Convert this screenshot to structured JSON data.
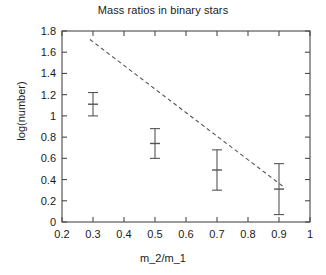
{
  "chart_data": {
    "type": "scatter",
    "title": "Mass ratios in binary stars",
    "xlabel": "m_2/m_1",
    "ylabel": "log(number)",
    "xlim": [
      0.2,
      1.0
    ],
    "ylim": [
      0,
      1.8
    ],
    "grid": false,
    "legend": null,
    "x_ticks": [
      "0.2",
      "0.3",
      "0.4",
      "0.5",
      "0.6",
      "0.7",
      "0.8",
      "0.9",
      "1"
    ],
    "x_tick_values": [
      0.2,
      0.3,
      0.4,
      0.5,
      0.6,
      0.7,
      0.8,
      0.9,
      1.0
    ],
    "y_ticks": [
      "0",
      "0.2",
      "0.4",
      "0.6",
      "0.8",
      "1",
      "1.2",
      "1.4",
      "1.6",
      "1.8"
    ],
    "y_tick_values": [
      0,
      0.2,
      0.4,
      0.6,
      0.8,
      1.0,
      1.2,
      1.4,
      1.6,
      1.8
    ],
    "x": [
      0.3,
      0.5,
      0.7,
      0.9
    ],
    "values": [
      1.11,
      0.74,
      0.49,
      0.31
    ],
    "yerr_low": [
      1.0,
      0.6,
      0.3,
      0.07
    ],
    "yerr_high": [
      1.22,
      0.88,
      0.68,
      0.55
    ],
    "series": [
      {
        "name": "observed counts",
        "style": "errorbar",
        "x": [
          0.3,
          0.5,
          0.7,
          0.9
        ],
        "values": [
          1.11,
          0.74,
          0.49,
          0.31
        ],
        "yerr_low": [
          1.0,
          0.6,
          0.3,
          0.07
        ],
        "yerr_high": [
          1.22,
          0.88,
          0.68,
          0.55
        ],
        "color": "#555555"
      },
      {
        "name": "fitted trend",
        "style": "dashed-line",
        "x": [
          0.29,
          0.92
        ],
        "values": [
          1.72,
          0.32
        ],
        "color": "#555555"
      }
    ],
    "colors": {
      "axis": "#4a4a4a",
      "text": "#1a1a1a",
      "errorbar": "#6a6a6a",
      "trendline": "#5a5a5a",
      "background": "#ffffff"
    }
  }
}
